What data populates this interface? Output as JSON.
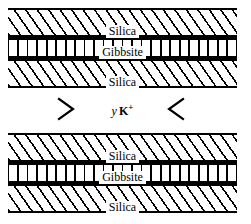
{
  "diagram": {
    "background_color": "#ffffff",
    "line_color": "#000000",
    "stacks": [
      {
        "id": "upper-stack",
        "layers": [
          {
            "name": "silica-upper",
            "label": "Silica",
            "pattern": "diagonal-hatch"
          },
          {
            "name": "gibbsite",
            "label": "Gibbsite",
            "pattern": "vertical-hatch"
          },
          {
            "name": "silica-lower",
            "label": "Silica",
            "pattern": "diagonal-hatch"
          }
        ]
      },
      {
        "id": "lower-stack",
        "layers": [
          {
            "name": "silica-upper",
            "label": "Silica",
            "pattern": "diagonal-hatch"
          },
          {
            "name": "gibbsite",
            "label": "Gibbsite",
            "pattern": "vertical-hatch"
          },
          {
            "name": "silica-lower",
            "label": "Silica",
            "pattern": "diagonal-hatch"
          }
        ]
      }
    ],
    "interlayer": {
      "name": "interlayer-gap",
      "coefficient": "y",
      "species": "K",
      "charge": "+",
      "left_marker": "chevron-right-icon",
      "right_marker": "chevron-left-icon"
    }
  }
}
